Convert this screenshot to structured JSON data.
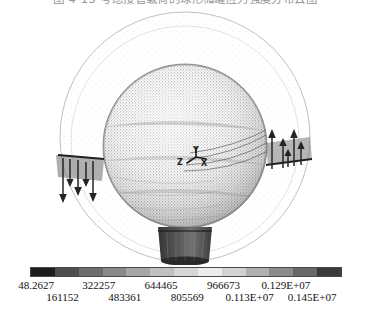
{
  "figure": {
    "caption": "图 4-15  考虑接管载荷的球形储罐应力强度分布云图",
    "caption_visible_note": "clipped"
  },
  "plot": {
    "title_axes_triad": {
      "y": "Y",
      "x": "X",
      "z": "Z"
    },
    "background": "#ffffff",
    "outer_boundary_color": "#b9b9b9",
    "mesh_color": "#808080",
    "nozzle_color": "#3c3c3c",
    "arrow_color": "#242424",
    "components": {
      "vessel": "spherical-shell-mesh",
      "top_nozzle": "top-nozzle",
      "bottom_nozzle": "bottom-nozzle",
      "left_nozzle": "left-nozzle",
      "right_nozzle": "right-nozzle",
      "left_load_arrows": "downward",
      "right_load_arrows": "upward"
    }
  },
  "colorbar": {
    "orientation": "horizontal",
    "type": "grayscale-contour",
    "bands": [
      "#1c1c1c",
      "#4e4e4e",
      "#6e6e6e",
      "#8a8a8a",
      "#a6a6a6",
      "#c0c0c0",
      "#d6d6d6",
      "#ececec",
      "#d2d2d2",
      "#b0b0b0",
      "#8c8c8c",
      "#686868",
      "#3a3a3a"
    ],
    "ticks_upper": [
      "48.2627",
      "322257",
      "644465",
      "966673",
      "0.129E+07"
    ],
    "ticks_lower": [
      "161152",
      "483361",
      "805569",
      "0.113E+07",
      "0.145E+07"
    ]
  },
  "chart_data": {
    "type": "heatmap",
    "title": "图 4-15  考虑接管载荷的球形储罐应力强度分布云图",
    "xlabel": "",
    "ylabel": "",
    "legend_position": "bottom",
    "grid": false,
    "colormap": "grayscale",
    "contour_levels": [
      48.2627,
      161152,
      322257,
      483361,
      644465,
      805569,
      966673,
      1130000,
      1290000,
      1450000
    ],
    "contour_level_labels": [
      "48.2627",
      "161152",
      "322257",
      "483361",
      "644465",
      "805569",
      "966673",
      "0.113E+07",
      "0.129E+07",
      "0.145E+07"
    ],
    "value_range": [
      48.2627,
      1450000
    ],
    "units": "Pa",
    "axis_triad": [
      "X",
      "Y",
      "Z"
    ],
    "annotations": [
      {
        "name": "axis-triad",
        "labels": [
          "Y",
          "X",
          "Z"
        ]
      },
      {
        "name": "left-nozzle-load-arrows",
        "direction": "down"
      },
      {
        "name": "right-nozzle-load-arrows",
        "direction": "up"
      }
    ]
  }
}
